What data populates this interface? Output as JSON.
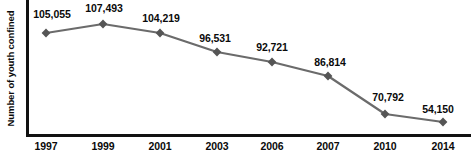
{
  "chart_data": {
    "type": "line",
    "title": "",
    "subtitle": "",
    "xlabel": "",
    "ylabel": "Number of youth confined",
    "categories": [
      "1997",
      "1999",
      "2001",
      "2003",
      "2006",
      "2007",
      "2010",
      "2014"
    ],
    "values": [
      105055,
      107493,
      104219,
      96531,
      92721,
      86814,
      70792,
      54150
    ],
    "value_labels": [
      "105,055",
      "107,493",
      "104,219",
      "96,531",
      "92,721",
      "86,814",
      "70,792",
      "54,150"
    ],
    "series": [
      {
        "name": "Number of youth confined",
        "values": [
          105055,
          107493,
          104219,
          96531,
          92721,
          86814,
          70792,
          54150
        ]
      }
    ],
    "ylim": [
      45000,
      112000
    ],
    "grid": false,
    "legend": false,
    "legend_position": "none",
    "marker": "diamond",
    "colors": {
      "line": "#6b6b6b",
      "marker": "#555555",
      "axis": "#111111",
      "text": "#0a0a0a",
      "background": "#ffffff"
    },
    "points": [
      {
        "x": "1997",
        "value": 105055,
        "label": "105,055",
        "px": 46,
        "py": 33,
        "lx": 52,
        "ly": 8
      },
      {
        "x": "1999",
        "value": 107493,
        "label": "107,493",
        "px": 103,
        "py": 24,
        "lx": 104,
        "ly": 2
      },
      {
        "x": "2001",
        "value": 104219,
        "label": "104,219",
        "px": 160,
        "py": 33,
        "lx": 161,
        "ly": 12
      },
      {
        "x": "2003",
        "value": 96531,
        "label": "96,531",
        "px": 217,
        "py": 52,
        "lx": 215,
        "ly": 32
      },
      {
        "x": "2006",
        "value": 92721,
        "label": "92,721",
        "px": 272,
        "py": 62,
        "lx": 272,
        "ly": 41
      },
      {
        "x": "2007",
        "value": 86814,
        "label": "86,814",
        "px": 328,
        "py": 76,
        "lx": 330,
        "ly": 56
      },
      {
        "x": "2010",
        "value": 70792,
        "label": "70,792",
        "px": 385,
        "py": 114,
        "lx": 388,
        "ly": 91
      },
      {
        "x": "2014",
        "value": 54150,
        "label": "54,150",
        "px": 443,
        "py": 122,
        "lx": 438,
        "ly": 103
      }
    ],
    "xticks": [
      {
        "label": "1997",
        "px": 46
      },
      {
        "label": "1999",
        "px": 103
      },
      {
        "label": "2001",
        "px": 160
      },
      {
        "label": "2003",
        "px": 217
      },
      {
        "label": "2006",
        "px": 272
      },
      {
        "label": "2007",
        "px": 328
      },
      {
        "label": "2010",
        "px": 385
      },
      {
        "label": "2014",
        "px": 443
      }
    ]
  }
}
